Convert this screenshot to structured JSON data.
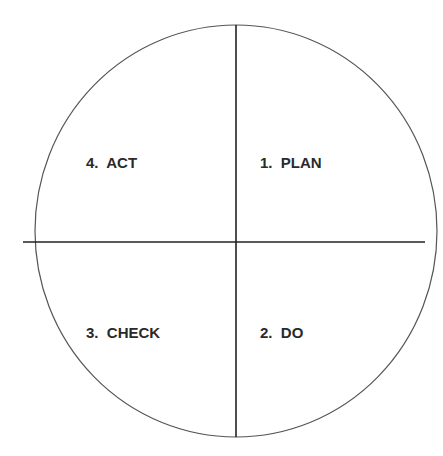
{
  "diagram": {
    "type": "pdca-cycle",
    "quadrants": [
      {
        "position": "top-right",
        "label": "1.  PLAN"
      },
      {
        "position": "bottom-right",
        "label": "2.  DO"
      },
      {
        "position": "bottom-left",
        "label": "3.  CHECK"
      },
      {
        "position": "top-left",
        "label": "4.  ACT"
      }
    ],
    "colors": {
      "stroke": "#333333",
      "background": "#ffffff",
      "text": "#2a2a2a"
    }
  }
}
